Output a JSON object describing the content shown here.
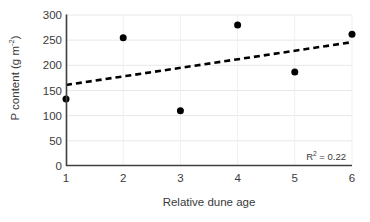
{
  "chart_data": {
    "type": "scatter",
    "title": "",
    "xlabel": "Relative dune age",
    "ylabel_text": "P content (g m",
    "ylabel_sup": "-2",
    "ylabel_tail": ")",
    "ylabel_full": "P content (g m-2)",
    "x": [
      1,
      2,
      3,
      4,
      5,
      6
    ],
    "values": [
      133,
      255,
      110,
      280,
      187,
      262
    ],
    "series": [
      {
        "name": "P content",
        "marker": "filled-circle",
        "color": "#000000",
        "points": [
          {
            "x": 1,
            "y": 133
          },
          {
            "x": 2,
            "y": 255
          },
          {
            "x": 3,
            "y": 110
          },
          {
            "x": 4,
            "y": 280
          },
          {
            "x": 5,
            "y": 187
          },
          {
            "x": 6,
            "y": 262
          }
        ]
      }
    ],
    "trendline": {
      "type": "linear-dashed",
      "color": "#000000",
      "x_start": 1,
      "y_start": 161,
      "x_end": 6,
      "y_end": 246,
      "slope": 17,
      "intercept": 144
    },
    "annotations": [
      {
        "name": "r-squared",
        "prefix": "R",
        "superscript": "2",
        "suffix": " = 0.22",
        "text": "R2 = 0.22",
        "value": 0.22
      }
    ],
    "xlim": [
      1,
      6
    ],
    "ylim": [
      0,
      300
    ],
    "xticks": [
      "1",
      "2",
      "3",
      "4",
      "5",
      "6"
    ],
    "yticks": [
      "0",
      "50",
      "100",
      "150",
      "200",
      "250",
      "300"
    ],
    "ytick_values": [
      0,
      50,
      100,
      150,
      200,
      250,
      300
    ],
    "xtick_values": [
      1,
      2,
      3,
      4,
      5,
      6
    ],
    "grid": {
      "horizontal": true,
      "vertical": true,
      "color": "#e8e8e8"
    },
    "legend": null,
    "axis_color": "#404040",
    "marker_size_px": 7
  }
}
